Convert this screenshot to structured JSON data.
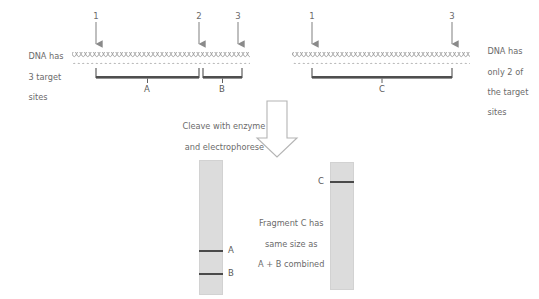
{
  "diagram": {
    "colors": {
      "text": "#6b6b6b",
      "arrow": "#8a8a8a",
      "dna": "#9a9a9a",
      "bracket": "#4f4f4f",
      "lane_fill": "#dcdcdc",
      "lane_border": "#d2d2d2",
      "band": "#4a4a4a",
      "block_arrow_stroke": "#b4b4b4",
      "background": "#ffffff"
    }
  },
  "left_panel": {
    "caption_lines": [
      "DNA has",
      "3 target",
      "sites"
    ],
    "site_labels": [
      "1",
      "2",
      "3"
    ],
    "fragments": [
      {
        "label": "A"
      },
      {
        "label": "B"
      }
    ]
  },
  "right_panel": {
    "caption_lines": [
      "DNA has",
      "only 2 of",
      "the target",
      "sites"
    ],
    "site_labels": [
      "1",
      "3"
    ],
    "fragments": [
      {
        "label": "C"
      }
    ]
  },
  "process": {
    "arrow_caption_lines": [
      "Cleave with enzyme",
      "and electrophorese"
    ],
    "block_arrow_icon": "down-block-arrow-icon"
  },
  "result": {
    "caption_lines": [
      "Fragment C has",
      "same size as",
      "A + B combined"
    ],
    "gel_left": {
      "name": "gel-lane-left",
      "bands": [
        {
          "label": "A"
        },
        {
          "label": "B"
        }
      ]
    },
    "gel_right": {
      "name": "gel-lane-right",
      "bands": [
        {
          "label": "C"
        }
      ]
    }
  }
}
